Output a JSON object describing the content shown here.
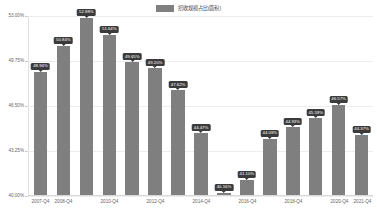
{
  "legend": {
    "label": "招收规模占比(面积)",
    "color": "#7f7f7f",
    "position": "top-center"
  },
  "chart_data": {
    "type": "bar",
    "title": "",
    "subtitle": "",
    "xlabel": "",
    "ylabel": "",
    "ylim": [
      40.0,
      53.0
    ],
    "grid": true,
    "legend_position": "top",
    "series_name": "招收规模占比(面积)",
    "bar_color": "#7f7f7f",
    "label_suffix": "%",
    "ytick_labels": [
      "53.00%",
      "49.75%",
      "46.50%",
      "43.25%",
      "40.00%"
    ],
    "ytick_values": [
      53.0,
      49.75,
      46.5,
      43.25,
      40.0
    ],
    "categories": [
      "2007-Q4",
      "2008-Q4",
      "",
      "2010-Q4",
      "",
      "2012-Q4",
      "",
      "2014-Q4",
      "",
      "2016-Q4",
      "",
      "2018-Q4",
      "",
      "2020-Q4",
      "2021-Q4"
    ],
    "x": [
      "2007-Q4",
      "2008-Q4",
      "2009-Q4",
      "2010-Q4",
      "2011-Q4",
      "2012-Q4",
      "2013-Q4",
      "2014-Q4",
      "2015-Q4",
      "2016-Q4",
      "2017-Q4",
      "2018-Q4",
      "2019-Q4",
      "2020-Q4",
      "2021-Q4"
    ],
    "values": [
      48.94,
      50.84,
      52.88,
      51.64,
      49.65,
      49.2,
      47.62,
      44.47,
      40.16,
      41.1,
      44.09,
      44.93,
      45.59,
      46.57,
      44.37
    ],
    "data_labels": [
      "48.94%",
      "50.84%",
      "52.88%",
      "51.64%",
      "49.65%",
      "49.20%",
      "47.62%",
      "44.47%",
      "40.16%",
      "41.10%",
      "44.09%",
      "44.93%",
      "45.59%",
      "46.57%",
      "44.37%"
    ]
  }
}
